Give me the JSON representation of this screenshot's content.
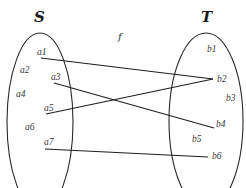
{
  "diagram": {
    "function_label": "f",
    "domain_set": {
      "name": "S",
      "elements": [
        "a1",
        "a2",
        "a3",
        "a4",
        "a5",
        "a6",
        "a7"
      ]
    },
    "codomain_set": {
      "name": "T",
      "elements": [
        "b1",
        "b2",
        "b3",
        "b4",
        "b5",
        "b6"
      ]
    },
    "mappings": [
      {
        "from": "a1",
        "to": "b2"
      },
      {
        "from": "a3",
        "to": "b4"
      },
      {
        "from": "a5",
        "to": "b2"
      },
      {
        "from": "a7",
        "to": "b6"
      }
    ],
    "colors": {
      "stroke": "#1e1e1e",
      "text": "#3a3a3a",
      "background": "#ffffff"
    }
  }
}
